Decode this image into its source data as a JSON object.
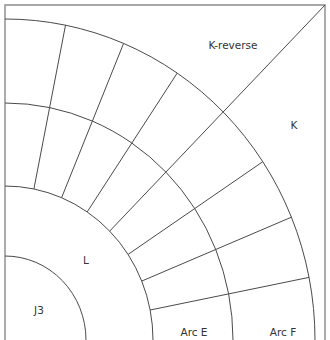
{
  "diagram": {
    "title": "",
    "colors": {
      "line": "#4a4a4a",
      "border": "#8a8a8a",
      "text": "#333333",
      "background": "#ffffff"
    },
    "center": {
      "x": 5,
      "y": 340
    },
    "arcs": [
      {
        "id": "J3",
        "rx": 81,
        "ry": 84
      },
      {
        "id": "L",
        "rx": 148,
        "ry": 154
      },
      {
        "id": "E",
        "rx": 228,
        "ry": 237
      },
      {
        "id": "F",
        "rx": 310,
        "ry": 321
      }
    ],
    "spoke_angles_deg": [
      11.25,
      22.5,
      33.75,
      56.25,
      67.5,
      78.75
    ],
    "diagonal": {
      "from": "arc L at 45°",
      "to": "top-right corner"
    },
    "labels": [
      {
        "id": "k-reverse",
        "text": "K-reverse",
        "x": 233,
        "y": 45
      },
      {
        "id": "k",
        "text": "K",
        "x": 294,
        "y": 125
      },
      {
        "id": "l",
        "text": "L",
        "x": 86,
        "y": 260
      },
      {
        "id": "j3",
        "text": "J3",
        "x": 39,
        "y": 310
      },
      {
        "id": "arc-e",
        "text": "Arc E",
        "x": 194,
        "y": 332
      },
      {
        "id": "arc-f",
        "text": "Arc F",
        "x": 283,
        "y": 332
      }
    ]
  }
}
